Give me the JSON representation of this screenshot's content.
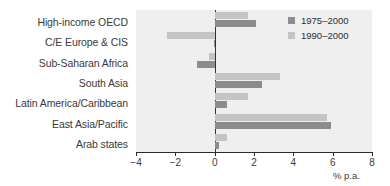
{
  "chart_data": {
    "type": "bar",
    "orientation": "horizontal",
    "title": "",
    "subtitle": "",
    "xlabel": "% p.a.",
    "ylabel": "",
    "xlim": [
      -4,
      8
    ],
    "xticks": [
      -4,
      -2,
      0,
      2,
      4,
      6,
      8
    ],
    "xticklabels": [
      "−4",
      "−2",
      "0",
      "2",
      "4",
      "6",
      "8"
    ],
    "grid": false,
    "legend_position": "top-right",
    "categories": [
      "High-income OECD",
      "C/E Europe & CIS",
      "Sub-Saharan Africa",
      "South Asia",
      "Latin America/Caribbean",
      "East Asia/Pacific",
      "Arab states"
    ],
    "series": [
      {
        "name": "1975–2000",
        "color": "#8c8c8c",
        "values": [
          2.1,
          -0.05,
          -0.9,
          2.4,
          0.65,
          5.9,
          0.2
        ]
      },
      {
        "name": "1990–2000",
        "color": "#c4c4c4",
        "values": [
          1.7,
          -2.4,
          -0.3,
          3.3,
          1.7,
          5.7,
          0.65
        ]
      }
    ]
  },
  "legend": {
    "items": [
      {
        "label": "1975–2000",
        "swatch": "s0"
      },
      {
        "label": "1990–2000",
        "swatch": "s1"
      }
    ]
  },
  "axis": {
    "unit_label": "% p.a."
  },
  "colors": {
    "plot_background": "#efefef",
    "series_1975": "#8c8c8c",
    "series_1990": "#c4c4c4",
    "axis": "#2b2b2b",
    "text": "#3a3a3a"
  }
}
